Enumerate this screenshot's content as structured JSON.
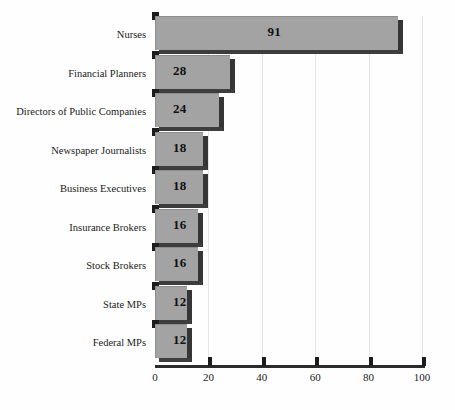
{
  "chart_data": {
    "type": "bar",
    "orientation": "horizontal",
    "title": "",
    "subtitle": "",
    "xlabel": "",
    "ylabel": "",
    "xlim": [
      0,
      100
    ],
    "xticks": [
      0,
      20,
      40,
      60,
      80,
      100
    ],
    "tick_labels": [
      "0",
      "20",
      "40",
      "60",
      "80",
      "100"
    ],
    "grid": true,
    "grid_axis": "x",
    "legend": false,
    "legend_position": "none",
    "style": "3d-bars",
    "categories": [
      "Nurses",
      "Financial Planners",
      "Directors of Public Companies",
      "Newspaper Journalists",
      "Business Executives",
      "Insurance Brokers",
      "Stock Brokers",
      "State MPs",
      "Federal MPs"
    ],
    "values": [
      91,
      28,
      24,
      18,
      18,
      16,
      16,
      12,
      12
    ],
    "data_labels": [
      "91",
      "28",
      "24",
      "18",
      "18",
      "16",
      "16",
      "12",
      "12"
    ],
    "colors": {
      "bar_face": "#a3a3a3",
      "bar_side": "#353535",
      "bar_bottom": "#3d3d3d",
      "bar_notch": "#1c1c1c",
      "axis": "#2b2b2b",
      "gridline": "#e6e6e6",
      "text": "#1a1a1a",
      "background": "#fefefe"
    }
  }
}
